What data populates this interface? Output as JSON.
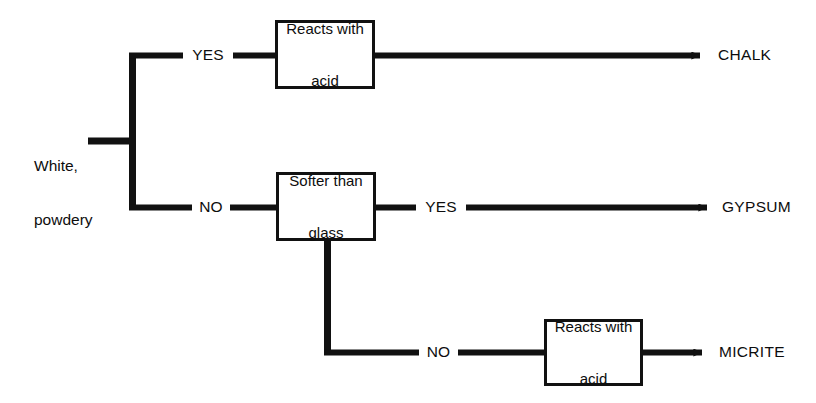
{
  "diagram": {
    "type": "decision-tree-flowchart",
    "background_color": "#ffffff",
    "line_color": "#111111",
    "text_color": "#0d0d0d",
    "start": {
      "line1": "White,",
      "line2": "powdery"
    },
    "tests": {
      "reacts_with_acid_top": {
        "line1": "Reacts with",
        "line2": "acid"
      },
      "softer_than_glass": {
        "line1": "Softer than",
        "line2": "glass"
      },
      "reacts_with_acid_bottom": {
        "line1": "Reacts with",
        "line2": "acid"
      }
    },
    "edges": {
      "top_yes": "YES",
      "trunk_no": "NO",
      "softer_yes": "YES",
      "softer_no": "NO"
    },
    "results": {
      "chalk": "CHALK",
      "gypsum": "GYPSUM",
      "micrite": "MICRITE"
    }
  }
}
